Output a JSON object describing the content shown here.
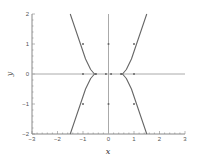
{
  "chart_data": {
    "type": "line",
    "title": "",
    "xlabel": "x",
    "ylabel": "y",
    "xlim": [
      -3,
      3
    ],
    "ylim": [
      -2,
      2
    ],
    "xticks": [
      -3,
      -2,
      -1,
      0,
      1,
      2,
      3
    ],
    "yticks": [
      -2,
      -1,
      0,
      1,
      2
    ],
    "grid": false,
    "legend": null,
    "series": [
      {
        "name": "x-axis-trajectory",
        "points": [
          [
            -3,
            0
          ],
          [
            3,
            0
          ]
        ],
        "color": "#aaaaaa"
      },
      {
        "name": "y-axis-trajectory",
        "points": [
          [
            0,
            -2
          ],
          [
            0,
            2
          ]
        ],
        "color": "#aaaaaa"
      },
      {
        "name": "upper-left-curve",
        "points": [
          [
            -1.5,
            2
          ],
          [
            -1.3,
            1.5
          ],
          [
            -1.1,
            1.0
          ],
          [
            -0.9,
            0.5
          ],
          [
            -0.7,
            0.15
          ],
          [
            -0.55,
            0
          ],
          [
            -0.45,
            0
          ]
        ],
        "color": "#666666"
      },
      {
        "name": "lower-left-curve",
        "points": [
          [
            -0.55,
            0
          ],
          [
            -0.7,
            -0.15
          ],
          [
            -0.9,
            -0.5
          ],
          [
            -1.1,
            -1.0
          ],
          [
            -1.3,
            -1.5
          ],
          [
            -1.5,
            -2
          ]
        ],
        "color": "#666666"
      },
      {
        "name": "upper-right-curve",
        "points": [
          [
            1.5,
            2
          ],
          [
            1.3,
            1.5
          ],
          [
            1.1,
            1.0
          ],
          [
            0.9,
            0.5
          ],
          [
            0.7,
            0.15
          ],
          [
            0.55,
            0
          ],
          [
            0.45,
            0
          ]
        ],
        "color": "#666666"
      },
      {
        "name": "lower-right-curve",
        "points": [
          [
            0.55,
            0
          ],
          [
            0.7,
            -0.15
          ],
          [
            0.9,
            -0.5
          ],
          [
            1.1,
            -1.0
          ],
          [
            1.3,
            -1.5
          ],
          [
            1.5,
            -2
          ]
        ],
        "color": "#666666"
      }
    ],
    "markers": [
      [
        -1,
        1
      ],
      [
        1,
        1
      ],
      [
        -1,
        -1
      ],
      [
        1,
        -1
      ],
      [
        -1,
        0
      ],
      [
        1,
        0
      ],
      [
        0,
        1
      ],
      [
        0,
        -1
      ],
      [
        -0.1,
        0
      ],
      [
        0.1,
        0
      ],
      [
        -0.5,
        0
      ],
      [
        0.5,
        0
      ]
    ]
  }
}
